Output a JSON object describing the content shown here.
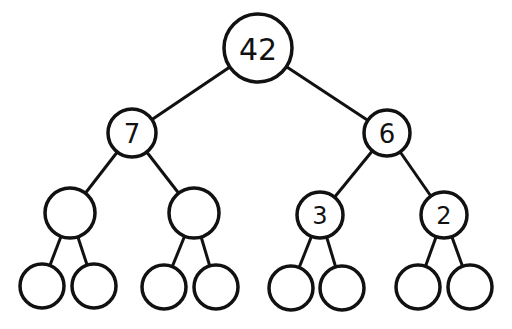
{
  "diagram": {
    "type": "binary-tree",
    "colors": {
      "stroke": "#111111",
      "fill": "#ffffff",
      "text": "#111111"
    },
    "nodes": [
      {
        "id": "n0",
        "label": "42",
        "cx": 258,
        "cy": 48,
        "r": 34,
        "fs": 30
      },
      {
        "id": "n1",
        "label": "7",
        "cx": 132,
        "cy": 133,
        "r": 24,
        "fs": 26
      },
      {
        "id": "n2",
        "label": "6",
        "cx": 387,
        "cy": 133,
        "r": 23,
        "fs": 26
      },
      {
        "id": "n3",
        "label": "",
        "cx": 70,
        "cy": 213,
        "r": 25,
        "fs": 24
      },
      {
        "id": "n4",
        "label": "",
        "cx": 194,
        "cy": 213,
        "r": 25,
        "fs": 24
      },
      {
        "id": "n5",
        "label": "3",
        "cx": 320,
        "cy": 215,
        "r": 23,
        "fs": 24
      },
      {
        "id": "n6",
        "label": "2",
        "cx": 444,
        "cy": 215,
        "r": 23,
        "fs": 24
      },
      {
        "id": "n7",
        "label": "",
        "cx": 42,
        "cy": 286,
        "r": 22,
        "fs": 20
      },
      {
        "id": "n8",
        "label": "",
        "cx": 94,
        "cy": 286,
        "r": 22,
        "fs": 20
      },
      {
        "id": "n9",
        "label": "",
        "cx": 164,
        "cy": 287,
        "r": 22,
        "fs": 20
      },
      {
        "id": "n10",
        "label": "",
        "cx": 216,
        "cy": 287,
        "r": 22,
        "fs": 20
      },
      {
        "id": "n11",
        "label": "",
        "cx": 291,
        "cy": 288,
        "r": 22,
        "fs": 20
      },
      {
        "id": "n12",
        "label": "",
        "cx": 342,
        "cy": 288,
        "r": 22,
        "fs": 20
      },
      {
        "id": "n13",
        "label": "",
        "cx": 418,
        "cy": 287,
        "r": 22,
        "fs": 20
      },
      {
        "id": "n14",
        "label": "",
        "cx": 470,
        "cy": 287,
        "r": 22,
        "fs": 20
      }
    ],
    "edges": [
      [
        "n0",
        "n1"
      ],
      [
        "n0",
        "n2"
      ],
      [
        "n1",
        "n3"
      ],
      [
        "n1",
        "n4"
      ],
      [
        "n2",
        "n5"
      ],
      [
        "n2",
        "n6"
      ],
      [
        "n3",
        "n7"
      ],
      [
        "n3",
        "n8"
      ],
      [
        "n4",
        "n9"
      ],
      [
        "n4",
        "n10"
      ],
      [
        "n5",
        "n11"
      ],
      [
        "n5",
        "n12"
      ],
      [
        "n6",
        "n13"
      ],
      [
        "n6",
        "n14"
      ]
    ]
  }
}
